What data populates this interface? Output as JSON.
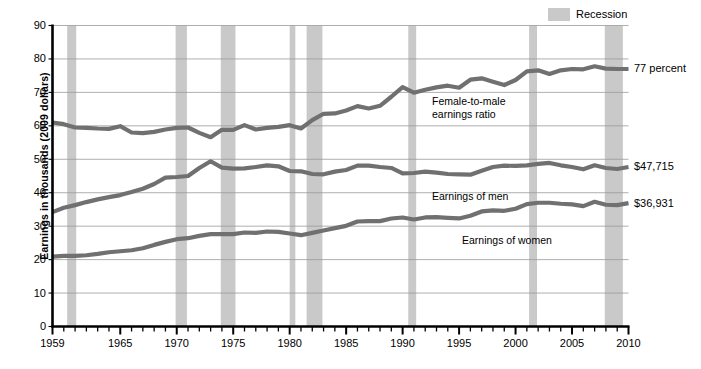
{
  "legend": {
    "recession_label": "Recession",
    "recession_color": "#c9c9c9"
  },
  "axes": {
    "ylabel": "Earnings in thousands (2009 dollars)",
    "yticks": [
      "0",
      "10",
      "20",
      "30",
      "40",
      "50",
      "60",
      "70",
      "80",
      "90"
    ],
    "xticks": [
      "1959",
      "1965",
      "1970",
      "1975",
      "1980",
      "1985",
      "1990",
      "1995",
      "2000",
      "2005",
      "2010"
    ]
  },
  "annotations": {
    "ratio_line1": "Female-to-male",
    "ratio_line2": "earnings ratio",
    "men_label": "Earnings of men",
    "women_label": "Earnings of women"
  },
  "end_labels": {
    "ratio": "77 percent",
    "men": "$47,715",
    "women": "$36,931"
  },
  "chart_data": {
    "type": "line",
    "title": "",
    "xlabel": "",
    "ylabel": "Earnings in thousands (2009 dollars)",
    "xlim": [
      1959,
      2010
    ],
    "ylim": [
      0,
      90
    ],
    "grid": true,
    "legend_position": "top-right",
    "line_color": "#707070",
    "x": [
      1959,
      1960,
      1961,
      1962,
      1963,
      1964,
      1965,
      1966,
      1967,
      1968,
      1969,
      1970,
      1971,
      1972,
      1973,
      1974,
      1975,
      1976,
      1977,
      1978,
      1979,
      1980,
      1981,
      1982,
      1983,
      1984,
      1985,
      1986,
      1987,
      1988,
      1989,
      1990,
      1991,
      1992,
      1993,
      1994,
      1995,
      1996,
      1997,
      1998,
      1999,
      2000,
      2001,
      2002,
      2003,
      2004,
      2005,
      2006,
      2007,
      2008,
      2009,
      2010
    ],
    "series": [
      {
        "name": "Female-to-male earnings ratio",
        "unit": "percent",
        "values": [
          61.0,
          60.5,
          59.5,
          59.4,
          59.2,
          59.1,
          59.9,
          58.0,
          57.8,
          58.2,
          58.9,
          59.4,
          59.5,
          57.9,
          56.6,
          58.8,
          58.8,
          60.2,
          58.9,
          59.4,
          59.7,
          60.2,
          59.2,
          61.7,
          63.6,
          63.7,
          64.6,
          65.9,
          65.2,
          66.0,
          68.7,
          71.6,
          69.9,
          70.8,
          71.5,
          72.0,
          71.4,
          73.8,
          74.2,
          73.2,
          72.2,
          73.7,
          76.3,
          76.6,
          75.5,
          76.6,
          77.0,
          76.9,
          77.8,
          77.1,
          77.0,
          77.0
        ],
        "end_value_label": "77 percent"
      },
      {
        "name": "Earnings of men",
        "unit": "thousands of 2009 dollars",
        "values": [
          34.2,
          35.5,
          36.3,
          37.2,
          38.0,
          38.7,
          39.3,
          40.2,
          41.2,
          42.6,
          44.5,
          44.7,
          45.0,
          47.4,
          49.4,
          47.5,
          47.2,
          47.3,
          47.7,
          48.2,
          47.9,
          46.5,
          46.4,
          45.6,
          45.5,
          46.3,
          46.8,
          48.1,
          48.1,
          47.7,
          47.4,
          45.8,
          45.9,
          46.3,
          46.0,
          45.6,
          45.5,
          45.4,
          46.6,
          47.7,
          48.1,
          48.0,
          48.2,
          48.6,
          48.9,
          48.2,
          47.7,
          47.0,
          48.2,
          47.4,
          47.1,
          47.7
        ],
        "end_value_label": "$47,715"
      },
      {
        "name": "Earnings of women",
        "unit": "thousands of 2009 dollars",
        "values": [
          20.9,
          21.1,
          21.1,
          21.3,
          21.7,
          22.2,
          22.5,
          22.8,
          23.4,
          24.4,
          25.3,
          26.1,
          26.4,
          27.1,
          27.6,
          27.6,
          27.6,
          28.1,
          28.0,
          28.4,
          28.3,
          27.8,
          27.3,
          28.0,
          28.7,
          29.4,
          30.1,
          31.4,
          31.5,
          31.5,
          32.3,
          32.6,
          32.0,
          32.6,
          32.7,
          32.5,
          32.3,
          33.1,
          34.4,
          34.7,
          34.6,
          35.2,
          36.6,
          37.0,
          37.0,
          36.7,
          36.5,
          36.0,
          37.3,
          36.4,
          36.3,
          36.9
        ],
        "end_value_label": "$36,931"
      }
    ],
    "recessions": [
      {
        "start": 1960.3,
        "end": 1961.1
      },
      {
        "start": 1969.9,
        "end": 1970.9
      },
      {
        "start": 1973.9,
        "end": 1975.2
      },
      {
        "start": 1980.0,
        "end": 1980.5
      },
      {
        "start": 1981.5,
        "end": 1982.9
      },
      {
        "start": 1990.5,
        "end": 1991.2
      },
      {
        "start": 2001.2,
        "end": 2001.9
      },
      {
        "start": 2007.9,
        "end": 2009.5
      }
    ]
  }
}
